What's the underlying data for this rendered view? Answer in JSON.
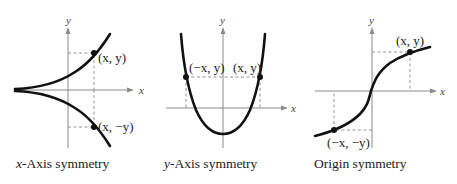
{
  "panels": [
    {
      "id": "x-axis-symmetry",
      "caption_var": "x",
      "caption_rest": "-Axis symmetry",
      "axis_x_label": "x",
      "axis_y_label": "y",
      "point_labels": [
        "(x, y)",
        "(x, −y)"
      ]
    },
    {
      "id": "y-axis-symmetry",
      "caption_var": "y",
      "caption_rest": "-Axis symmetry",
      "axis_x_label": "x",
      "axis_y_label": "y",
      "point_labels": [
        "(−x, y)",
        "(x, y)"
      ]
    },
    {
      "id": "origin-symmetry",
      "caption_var": "",
      "caption_rest": "Origin symmetry",
      "axis_x_label": "x",
      "axis_y_label": "y",
      "point_labels": [
        "(x, y)",
        "(−x, −y)"
      ]
    }
  ],
  "colors": {
    "curve": "#111111",
    "axis": "#8a8a8a",
    "text": "#222222",
    "background": "#ffffff"
  }
}
